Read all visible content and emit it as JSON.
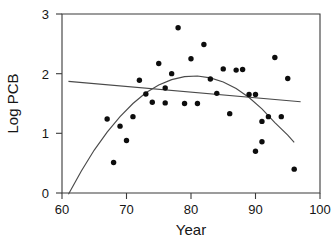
{
  "chart_data": {
    "type": "scatter",
    "title": "",
    "xlabel": "Year",
    "ylabel": "Log PCB",
    "xlim": [
      60,
      100
    ],
    "ylim": [
      0,
      3
    ],
    "xticks": [
      60,
      70,
      80,
      90,
      100
    ],
    "yticks": [
      0,
      1,
      2,
      3
    ],
    "grid": false,
    "legend": "none",
    "point_color": "#0d0d0d",
    "line_color": "#4a4a4a",
    "x": [
      67,
      68,
      69,
      70,
      71,
      72,
      73,
      74,
      75,
      76,
      76,
      77,
      78,
      79,
      80,
      81,
      82,
      83,
      84,
      85,
      86,
      87,
      88,
      89,
      90,
      90,
      91,
      91,
      92,
      93,
      94,
      95,
      96
    ],
    "y": [
      1.24,
      0.51,
      1.12,
      0.88,
      1.28,
      1.89,
      1.66,
      1.52,
      2.17,
      1.76,
      1.51,
      2.0,
      2.77,
      1.5,
      2.25,
      1.5,
      2.49,
      1.91,
      1.67,
      2.08,
      1.33,
      2.06,
      2.07,
      1.65,
      1.65,
      0.7,
      1.2,
      0.86,
      1.28,
      2.27,
      1.28,
      1.92,
      0.4
    ],
    "series": [
      {
        "name": "observations",
        "marker": "filled-circle",
        "points": [
          {
            "x": 67,
            "y": 1.24
          },
          {
            "x": 68,
            "y": 0.51
          },
          {
            "x": 69,
            "y": 1.12
          },
          {
            "x": 70,
            "y": 0.88
          },
          {
            "x": 71,
            "y": 1.28
          },
          {
            "x": 72,
            "y": 1.89
          },
          {
            "x": 73,
            "y": 1.66
          },
          {
            "x": 74,
            "y": 1.52
          },
          {
            "x": 75,
            "y": 2.17
          },
          {
            "x": 76,
            "y": 1.76
          },
          {
            "x": 76,
            "y": 1.51
          },
          {
            "x": 77,
            "y": 2.0
          },
          {
            "x": 78,
            "y": 2.77
          },
          {
            "x": 79,
            "y": 1.5
          },
          {
            "x": 80,
            "y": 2.25
          },
          {
            "x": 81,
            "y": 1.5
          },
          {
            "x": 82,
            "y": 2.49
          },
          {
            "x": 83,
            "y": 1.91
          },
          {
            "x": 84,
            "y": 1.67
          },
          {
            "x": 85,
            "y": 2.08
          },
          {
            "x": 86,
            "y": 1.33
          },
          {
            "x": 87,
            "y": 2.06
          },
          {
            "x": 88,
            "y": 2.07
          },
          {
            "x": 89,
            "y": 1.65
          },
          {
            "x": 90,
            "y": 1.65
          },
          {
            "x": 90,
            "y": 0.7
          },
          {
            "x": 91,
            "y": 1.2
          },
          {
            "x": 91,
            "y": 0.86
          },
          {
            "x": 92,
            "y": 1.28
          },
          {
            "x": 93,
            "y": 2.27
          },
          {
            "x": 94,
            "y": 1.28
          },
          {
            "x": 95,
            "y": 1.92
          },
          {
            "x": 96,
            "y": 0.4
          }
        ]
      },
      {
        "name": "quadratic-fit",
        "type": "curve",
        "xrange": [
          61,
          96
        ],
        "vertex": {
          "x": 81,
          "y": 1.96
        },
        "endpoints": [
          {
            "x": 61,
            "y": -0.02
          },
          {
            "x": 96,
            "y": 0.85
          }
        ],
        "samples": [
          {
            "x": 61,
            "y": -0.02
          },
          {
            "x": 63,
            "y": 0.37
          },
          {
            "x": 65,
            "y": 0.72
          },
          {
            "x": 67,
            "y": 1.02
          },
          {
            "x": 69,
            "y": 1.28
          },
          {
            "x": 71,
            "y": 1.5
          },
          {
            "x": 73,
            "y": 1.68
          },
          {
            "x": 75,
            "y": 1.81
          },
          {
            "x": 77,
            "y": 1.9
          },
          {
            "x": 79,
            "y": 1.95
          },
          {
            "x": 81,
            "y": 1.96
          },
          {
            "x": 83,
            "y": 1.93
          },
          {
            "x": 85,
            "y": 1.86
          },
          {
            "x": 87,
            "y": 1.75
          },
          {
            "x": 89,
            "y": 1.6
          },
          {
            "x": 91,
            "y": 1.41
          },
          {
            "x": 93,
            "y": 1.18
          },
          {
            "x": 95,
            "y": 0.97
          },
          {
            "x": 96,
            "y": 0.85
          }
        ]
      },
      {
        "name": "linear-fit",
        "type": "line",
        "endpoints": [
          {
            "x": 61,
            "y": 1.87
          },
          {
            "x": 97,
            "y": 1.53
          }
        ]
      }
    ]
  },
  "axes": {
    "x_tick_labels": [
      "60",
      "70",
      "80",
      "90",
      "100"
    ],
    "y_tick_labels": [
      "0",
      "1",
      "2",
      "3"
    ],
    "x_title": "Year",
    "y_title": "Log PCB"
  }
}
